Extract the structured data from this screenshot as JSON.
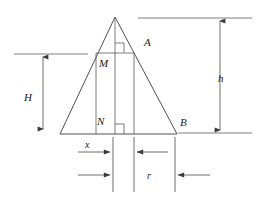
{
  "figure": {
    "type": "geometry-diagram",
    "width": 265,
    "height": 201,
    "background_color": "#ffffff",
    "line_color": "#3d3d3d"
  },
  "labels": {
    "vertex_a": "A",
    "vertex_b": "B",
    "point_m": "M",
    "point_n": "N",
    "height_big": "H",
    "height_small": "h",
    "width_x": "x",
    "radius_r": "r"
  },
  "geometry": {
    "triangle": {
      "apex": [
        115,
        17
      ],
      "base_left": [
        60,
        134
      ],
      "base_right": [
        177,
        134
      ]
    },
    "rectangle": {
      "left": 96,
      "right": 134,
      "top": 53,
      "bottom": 134
    },
    "axis_x": 115,
    "right_angle_upper": [
      114,
      43,
      9,
      9
    ],
    "right_angle_lower": [
      114,
      124,
      9,
      10
    ]
  },
  "dimensions": {
    "h": {
      "x": 220,
      "y_top": 18,
      "y_bottom": 133,
      "label_x": 222,
      "label_y": 78
    },
    "H": {
      "x": 43,
      "y_top": 54,
      "y_bottom": 132,
      "label_x": 29,
      "label_y": 98
    },
    "ref_line_top_right": {
      "x1": 138,
      "x2": 252,
      "y": 18
    },
    "ref_line_bottom_right": {
      "x1": 178,
      "x2": 252,
      "y": 133
    },
    "ref_line_left": {
      "x1": 14,
      "x2": 88,
      "y": 54
    },
    "tick_1_x": 113,
    "tick_2_x": 134,
    "tick_3_x": 175,
    "tick_top": 137,
    "tick_bottom": 192,
    "arrow_x_row_y": 152,
    "arrow_r_row_y": 175
  }
}
